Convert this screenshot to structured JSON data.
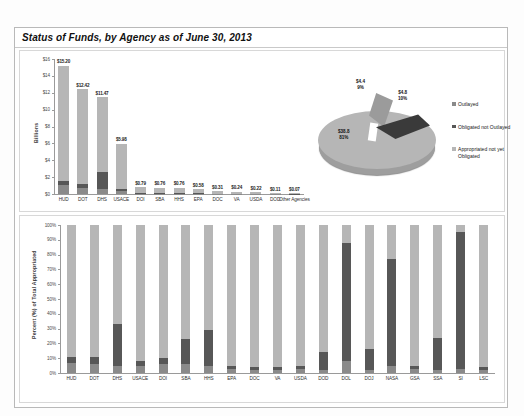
{
  "report": {
    "title": "Status of Funds, by Agency as of June 30, 2013"
  },
  "legend": {
    "items": [
      {
        "label": "Outlayed",
        "color": "#8a8a8a"
      },
      {
        "label": "Obligated not Outlayed",
        "color": "#575757"
      },
      {
        "label": "Appropriated not yet Obligated",
        "color": "#b6b6b6"
      }
    ]
  },
  "pie": {
    "caption": "Value in $ Billions",
    "labels": [
      {
        "value": "$4.4",
        "percent": "9%"
      },
      {
        "value": "$4.8",
        "percent": "10%"
      },
      {
        "value": "$38.8",
        "percent": "81%"
      }
    ]
  },
  "chart_data": [
    {
      "type": "bar",
      "id": "funds-by-agency",
      "title": "Status of Funds, by Agency as of June 30, 2013",
      "subtype": "stacked-bar",
      "xlabel": "",
      "ylabel": "Billions",
      "ylim": [
        0,
        16
      ],
      "yticks": [
        "$0",
        "$2",
        "$4",
        "$6",
        "$8",
        "$10",
        "$12",
        "$14",
        "$16"
      ],
      "grid": false,
      "categories": [
        "HUD",
        "DOT",
        "DHS",
        "USACE",
        "DOI",
        "SBA",
        "HHS",
        "EPA",
        "DOC",
        "VA",
        "USDA",
        "DOD",
        "Other Agencies"
      ],
      "data_labels": [
        "$15.20",
        "$12.42",
        "$11.47",
        "$5.98",
        "$0.79",
        "$0.76",
        "$0.76",
        "$0.58",
        "$0.31",
        "$0.24",
        "$0.22",
        "$0.11",
        "$0.07"
      ],
      "totals": [
        15.2,
        12.42,
        11.47,
        5.98,
        0.79,
        0.76,
        0.76,
        0.58,
        0.31,
        0.24,
        0.22,
        0.11,
        0.07
      ],
      "series": [
        {
          "name": "Outlayed",
          "color": "#8a8a8a",
          "values": [
            1.05,
            0.75,
            0.55,
            0.3,
            0.05,
            0.05,
            0.04,
            0.03,
            0.02,
            0.02,
            0.01,
            0.01,
            0.0
          ]
        },
        {
          "name": "Obligated not Outlayed",
          "color": "#575757",
          "values": [
            0.55,
            0.45,
            2.1,
            0.25,
            0.07,
            0.06,
            0.05,
            0.04,
            0.03,
            0.02,
            0.02,
            0.01,
            0.01
          ]
        },
        {
          "name": "Appropriated not yet Obligated",
          "color": "#b6b6b6",
          "values": [
            13.6,
            11.22,
            8.82,
            5.43,
            0.67,
            0.65,
            0.67,
            0.51,
            0.26,
            0.2,
            0.19,
            0.09,
            0.06
          ]
        }
      ]
    },
    {
      "type": "pie",
      "id": "funds-status-pie",
      "title": "Value in $ Billions",
      "labels": [
        "Outlayed",
        "Obligated not Outlayed",
        "Appropriated not yet Obligated"
      ],
      "values": [
        4.4,
        4.8,
        38.8
      ],
      "percents": [
        9,
        10,
        81
      ],
      "value_labels": [
        "$4.4",
        "$4.8",
        "$38.8"
      ],
      "percent_labels": [
        "9%",
        "10%",
        "81%"
      ],
      "colors": [
        "#9b9b9b",
        "#3a3a3a",
        "#b6b6b6"
      ],
      "legend_position": "right"
    },
    {
      "type": "bar",
      "id": "percent-of-total-appropriated",
      "subtype": "stacked-bar-100",
      "xlabel": "",
      "ylabel": "Percent (%) of Total Appropriated",
      "ylim": [
        0,
        100
      ],
      "yticks": [
        "0%",
        "10%",
        "20%",
        "30%",
        "40%",
        "50%",
        "60%",
        "70%",
        "80%",
        "90%",
        "100%"
      ],
      "grid": false,
      "categories": [
        "HUD",
        "DOT",
        "DHS",
        "USACE",
        "DOI",
        "SBA",
        "HHS",
        "EPA",
        "DOC",
        "VA",
        "USDA",
        "DOD",
        "DOL",
        "DOJ",
        "NASA",
        "GSA",
        "SSA",
        "SI",
        "LSC"
      ],
      "series": [
        {
          "name": "Outlayed",
          "color": "#8a8a8a",
          "values": [
            7,
            6,
            5,
            5,
            6,
            6,
            5,
            3,
            2,
            2,
            3,
            2,
            8,
            2,
            5,
            3,
            2,
            3,
            2
          ]
        },
        {
          "name": "Obligated not Outlayed",
          "color": "#575757",
          "values": [
            4,
            5,
            28,
            3,
            4,
            17,
            24,
            2,
            2,
            2,
            2,
            12,
            80,
            14,
            72,
            2,
            22,
            92,
            2
          ]
        },
        {
          "name": "Appropriated not yet Obligated",
          "color": "#b6b6b6",
          "values": [
            89,
            89,
            67,
            92,
            90,
            77,
            71,
            95,
            96,
            96,
            95,
            86,
            12,
            84,
            23,
            95,
            76,
            5,
            96
          ]
        }
      ]
    }
  ]
}
